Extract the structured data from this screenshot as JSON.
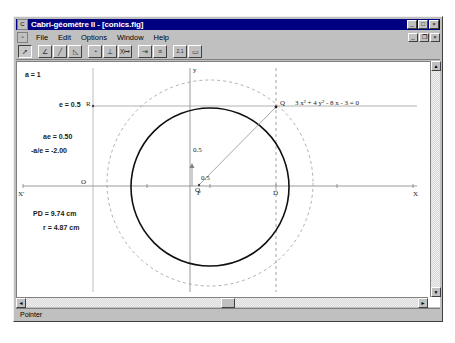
{
  "window": {
    "title": "Cabri-géomètre II - [conics.fig]",
    "icon": "app-icon",
    "buttons": {
      "minimize": "_",
      "maximize": "□",
      "close": "×"
    },
    "doc_buttons": {
      "minimize": "_",
      "restore": "❐",
      "close": "×"
    }
  },
  "menubar": {
    "doc_icon": "document-icon",
    "items": [
      {
        "label": "File"
      },
      {
        "label": "Edit"
      },
      {
        "label": "Options"
      },
      {
        "label": "Window"
      },
      {
        "label": "Help"
      }
    ]
  },
  "toolbar": {
    "buttons": [
      {
        "name": "pointer-tool",
        "glyph": "➚",
        "pressed": true
      },
      {
        "name": "point-tool",
        "glyph": "∠"
      },
      {
        "name": "line-tool",
        "glyph": "╱"
      },
      {
        "name": "polygon-tool",
        "glyph": "◺"
      },
      {
        "name": "circle-tool",
        "glyph": "◔"
      },
      {
        "name": "perpendicular-tool",
        "glyph": "⊥"
      },
      {
        "name": "transform-tool",
        "glyph": "X↦"
      },
      {
        "name": "macro-tool",
        "glyph": "⇥"
      },
      {
        "name": "property-tool",
        "glyph": "≡"
      },
      {
        "name": "measure-tool",
        "glyph": "2.1"
      },
      {
        "name": "display-tool",
        "glyph": "▭"
      }
    ]
  },
  "statusbar": {
    "text": "Pointer"
  },
  "figure": {
    "equation": "3 x² + 4 y² - 8 x - 3 = 0",
    "measurements": [
      {
        "name": "semi-major-axis",
        "text": "a = 1"
      },
      {
        "name": "eccentricity",
        "text": "e = 0.5"
      },
      {
        "name": "focal-distance",
        "text": "ae = 0.50"
      },
      {
        "name": "directrix-distance",
        "text": "-a/e = -2.00"
      },
      {
        "name": "pd-length",
        "text": "PD = 9.74 cm"
      },
      {
        "name": "radius-length",
        "text": "r = 4.87 cm"
      }
    ],
    "point_labels": [
      {
        "name": "point-label-R",
        "text": "R"
      },
      {
        "name": "point-label-O",
        "text": "O"
      },
      {
        "name": "point-label-F",
        "text": "F"
      },
      {
        "name": "point-label-D",
        "text": "D"
      },
      {
        "name": "point-label-Q",
        "text": "Q"
      },
      {
        "name": "point-label-O-left",
        "text": "O"
      }
    ],
    "axis_labels": [
      {
        "name": "axis-label-x-negative",
        "text": "X'"
      },
      {
        "name": "axis-label-x-positive",
        "text": "X"
      },
      {
        "name": "axis-label-y",
        "text": "y"
      }
    ],
    "tick_labels": [
      {
        "name": "tick-label-y-half",
        "text": "0.5"
      },
      {
        "name": "tick-label-x-half",
        "text": "0.5"
      }
    ],
    "colors": {
      "curve": "#101010",
      "construction": "#888888",
      "axis": "#707070",
      "dashed": "#999999"
    }
  }
}
